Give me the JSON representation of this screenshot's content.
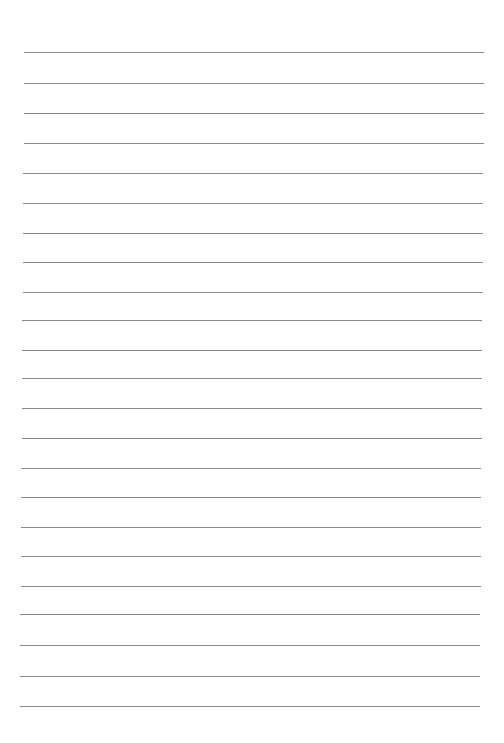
{
  "page": {
    "type": "lined-paper",
    "background": "#ffffff",
    "line_color": "#8a8a8a",
    "line_count": 23,
    "lines": [
      {
        "y": 52,
        "x1": 24,
        "x2": 484
      },
      {
        "y": 83,
        "x1": 24,
        "x2": 484
      },
      {
        "y": 113,
        "x1": 24,
        "x2": 484
      },
      {
        "y": 143,
        "x1": 24,
        "x2": 484
      },
      {
        "y": 173,
        "x1": 23,
        "x2": 483
      },
      {
        "y": 203,
        "x1": 23,
        "x2": 483
      },
      {
        "y": 233,
        "x1": 23,
        "x2": 483
      },
      {
        "y": 262,
        "x1": 23,
        "x2": 483
      },
      {
        "y": 292,
        "x1": 23,
        "x2": 483
      },
      {
        "y": 320,
        "x1": 22,
        "x2": 482
      },
      {
        "y": 350,
        "x1": 22,
        "x2": 482
      },
      {
        "y": 378,
        "x1": 22,
        "x2": 482
      },
      {
        "y": 408,
        "x1": 22,
        "x2": 482
      },
      {
        "y": 438,
        "x1": 22,
        "x2": 482
      },
      {
        "y": 468,
        "x1": 21,
        "x2": 481
      },
      {
        "y": 497,
        "x1": 21,
        "x2": 481
      },
      {
        "y": 527,
        "x1": 21,
        "x2": 481
      },
      {
        "y": 556,
        "x1": 21,
        "x2": 481
      },
      {
        "y": 586,
        "x1": 21,
        "x2": 481
      },
      {
        "y": 614,
        "x1": 20,
        "x2": 480
      },
      {
        "y": 645,
        "x1": 20,
        "x2": 480
      },
      {
        "y": 676,
        "x1": 20,
        "x2": 480
      },
      {
        "y": 706,
        "x1": 20,
        "x2": 480
      }
    ]
  }
}
